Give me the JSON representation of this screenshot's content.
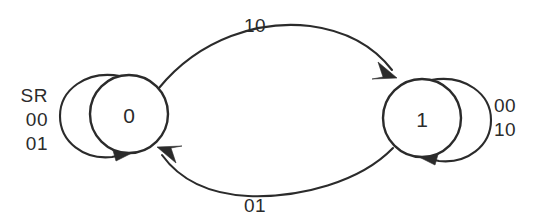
{
  "diagram": {
    "type": "state-transition-diagram",
    "background_color": "#ffffff",
    "stroke_color": "#2b2b2b",
    "states": [
      {
        "id": "s0",
        "label": "0",
        "cx": 129,
        "cy": 114,
        "r": 39
      },
      {
        "id": "s1",
        "label": "1",
        "cx": 422,
        "cy": 118,
        "r": 39
      }
    ],
    "transitions": [
      {
        "id": "t-0-to-1",
        "from": "0",
        "to": "1",
        "label": "10",
        "label_x": 255,
        "label_y": 25,
        "position": "top"
      },
      {
        "id": "t-1-to-0",
        "from": "1",
        "to": "0",
        "label": "01",
        "label_x": 255,
        "label_y": 205,
        "position": "bottom"
      }
    ],
    "self_loops": [
      {
        "id": "loop-s0",
        "state": "0",
        "side": "left",
        "label_lines": [
          "SR",
          "00",
          "01"
        ],
        "label_x": 48,
        "label_y": 95
      },
      {
        "id": "loop-s1",
        "state": "1",
        "side": "right",
        "label_lines": [
          "00",
          "10"
        ],
        "label_x": 492,
        "label_y": 105
      }
    ]
  }
}
